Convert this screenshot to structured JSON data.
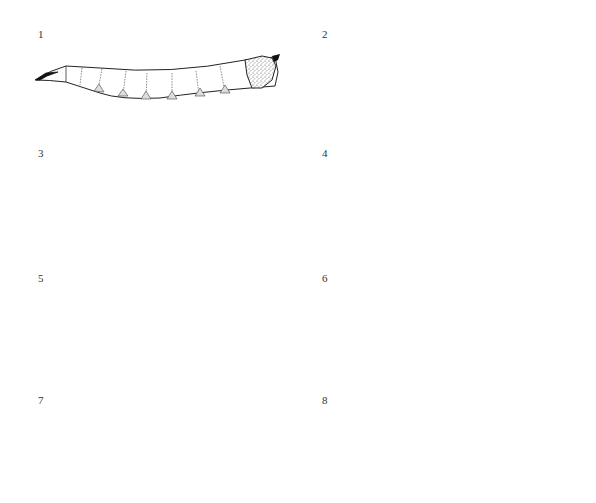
{
  "plate": {
    "title": "",
    "background": "#ffffff",
    "ink_color": "#222222"
  },
  "figures": [
    {
      "number": "1",
      "description": "slender larva, pointed head with mouth hooks at left, 8 body segments with ventral creeping welts, hairy/stippled posterior end with spiracles"
    },
    {
      "number": "2",
      "description": "slender larva, pointed head at left, segments with dorsal and ventral welts, tapering posterior with fleshy processes"
    },
    {
      "number": "3",
      "description": "stout larva, curved head end at left, segments with dorsal and ventral welts, posterior with short processes"
    },
    {
      "number": "4",
      "description": "stout larva densely stippled/hairy, segments with dorsal spines and V-shaped marks"
    },
    {
      "number": "5",
      "description": "cylindrical smooth larva, blunt head at left, segments with dorsal and ventral stippled welts"
    },
    {
      "number": "6",
      "description": "slender larva, pointed head with mouth hooks at left, segments with small ventral welts, truncated posterior"
    },
    {
      "number": "7",
      "description": "larva with alternating dark stippled and light banded segments, diamond markings, ragged posterior"
    },
    {
      "number": "8",
      "description": "larva densely stippled dark throughout with lighter head segment"
    }
  ]
}
